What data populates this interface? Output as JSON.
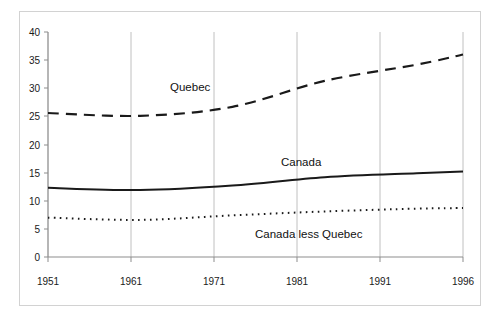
{
  "chart_data": {
    "type": "line",
    "title": "",
    "subtitle": "",
    "xlabel": "",
    "ylabel": "",
    "x": [
      1951,
      1961,
      1971,
      1981,
      1991,
      1996
    ],
    "xtick_labels": [
      "1951",
      "1961",
      "1971",
      "1981",
      "1991",
      "1996"
    ],
    "ytick_labels": [
      "0",
      "5",
      "10",
      "15",
      "20",
      "25",
      "30",
      "35",
      "40"
    ],
    "yticks": [
      0,
      5,
      10,
      15,
      20,
      25,
      30,
      35,
      40
    ],
    "xlim": [
      1951,
      1996
    ],
    "ylim": [
      0,
      40
    ],
    "grid": "vertical-only",
    "legend_position": "inline-annotations",
    "series": [
      {
        "name": "Quebec",
        "style": "dashed",
        "color": "#1a1a1a",
        "values": [
          25.6,
          25.1,
          26.7,
          31.3,
          34.2,
          36.0
        ],
        "label": "Quebec"
      },
      {
        "name": "Canada",
        "style": "solid",
        "color": "#1a1a1a",
        "values": [
          12.3,
          11.9,
          12.7,
          14.2,
          14.9,
          15.2
        ],
        "label": "Canada"
      },
      {
        "name": "Canada less Quebec",
        "style": "dotted",
        "color": "#1a1a1a",
        "values": [
          7.0,
          6.6,
          7.4,
          8.1,
          8.6,
          8.7
        ],
        "label": "Canada less Quebec"
      }
    ],
    "annotations": [
      {
        "text": "Quebec",
        "series": "Quebec"
      },
      {
        "text": "Canada",
        "series": "Canada"
      },
      {
        "text": "Canada less Quebec",
        "series": "Canada less Quebec"
      }
    ]
  },
  "axis": {
    "y_ticks": [
      {
        "label": "40"
      },
      {
        "label": "35"
      },
      {
        "label": "30"
      },
      {
        "label": "25"
      },
      {
        "label": "20"
      },
      {
        "label": "15"
      },
      {
        "label": "10"
      },
      {
        "label": "5"
      },
      {
        "label": "0"
      }
    ],
    "x_ticks": [
      {
        "label": "1951"
      },
      {
        "label": "1961"
      },
      {
        "label": "1971"
      },
      {
        "label": "1981"
      },
      {
        "label": "1991"
      },
      {
        "label": "1996"
      }
    ]
  },
  "colors": {
    "ink": "#1a1a1a",
    "axis": "#8d8d8d",
    "grid": "#b5b5b5",
    "frame": "#d2d2d2",
    "background": "#ffffff"
  }
}
